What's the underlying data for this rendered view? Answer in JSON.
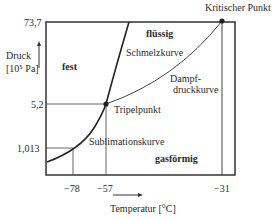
{
  "diagram": {
    "critical_point_label": "Kritischer Punkt",
    "y_axis": {
      "label_line1": "Druck",
      "label_line2": "[10⁵ Pa]",
      "ticks": [
        "73,7",
        "5,2",
        "1,013"
      ]
    },
    "x_axis": {
      "label": "Temperatur  [°C]",
      "ticks": [
        "−78",
        "−57",
        "−31"
      ]
    },
    "regions": {
      "solid": "fest",
      "liquid": "flüssig",
      "gas": "gasförmig"
    },
    "curves": {
      "melting": "Schmelzkurve",
      "vapor_line1": "Dampf-",
      "vapor_line2": "druckkurve",
      "sublimation": "Sublimationskurve"
    },
    "points": {
      "triple": "Tripelpunkt"
    }
  }
}
